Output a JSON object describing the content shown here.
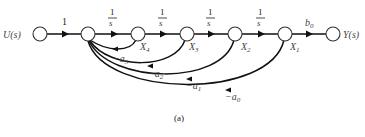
{
  "diagram": {
    "type": "signal-flow-graph",
    "caption": "(a)",
    "input_label": "U(s)",
    "output_label": "Y(s)",
    "nodes": [
      {
        "id": "U",
        "label": "U(s)"
      },
      {
        "id": "E",
        "label": ""
      },
      {
        "id": "X4",
        "label": "X",
        "sub": "4"
      },
      {
        "id": "X3",
        "label": "X",
        "sub": "3"
      },
      {
        "id": "X2",
        "label": "X",
        "sub": "2"
      },
      {
        "id": "X1",
        "label": "X",
        "sub": "1"
      },
      {
        "id": "Y",
        "label": "Y(s)"
      }
    ],
    "forward_gains": {
      "u_to_e": "1",
      "integrator_num": "1",
      "integrator_den": "s",
      "output_gain": "b",
      "output_gain_sub": "0"
    },
    "feedback_gains": [
      {
        "from": "X4",
        "label": "−a",
        "sub": "3"
      },
      {
        "from": "X3",
        "label": "−a",
        "sub": "2"
      },
      {
        "from": "X2",
        "label": "−a",
        "sub": "1"
      },
      {
        "from": "X1",
        "label": "−a",
        "sub": "0"
      }
    ]
  }
}
